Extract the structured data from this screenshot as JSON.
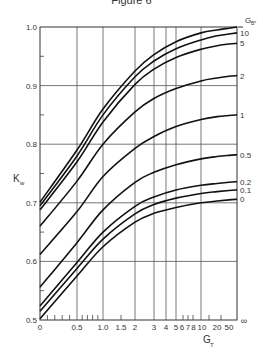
{
  "figure": {
    "title": "Figure 6"
  },
  "chart_data": {
    "type": "line",
    "title": "Figure 6",
    "xlabel": "G_T",
    "ylabel": "K_w",
    "legend_title": "G_B*",
    "x_scale": "nonlinear (compressed, G/(1+G)-like)",
    "x_tick_labels": [
      "0",
      "0.5",
      "1.0",
      "1.5",
      "2",
      "3",
      "4",
      "5",
      "6",
      "7",
      "8",
      "10",
      "20",
      "50",
      "∞"
    ],
    "y_tick_labels": [
      "0.5",
      "0.6",
      "0.7",
      "0.8",
      "0.9",
      "1.0"
    ],
    "ylim": [
      0.5,
      1.0
    ],
    "grid": true,
    "x": [
      0,
      0.5,
      1,
      2,
      3,
      5,
      10,
      20,
      50,
      "inf"
    ],
    "series": [
      {
        "name": "50",
        "values": [
          0.701,
          0.79,
          0.86,
          0.925,
          0.953,
          0.975,
          0.99,
          0.995,
          0.998,
          1.0
        ]
      },
      {
        "name": "10",
        "values": [
          0.695,
          0.78,
          0.85,
          0.915,
          0.942,
          0.963,
          0.978,
          0.985,
          0.988,
          0.99
        ]
      },
      {
        "name": "5",
        "values": [
          0.688,
          0.77,
          0.838,
          0.902,
          0.928,
          0.948,
          0.962,
          0.968,
          0.971,
          0.972
        ]
      },
      {
        "name": "2",
        "values": [
          0.66,
          0.737,
          0.8,
          0.855,
          0.878,
          0.895,
          0.908,
          0.913,
          0.916,
          0.917
        ]
      },
      {
        "name": "1",
        "values": [
          0.612,
          0.685,
          0.745,
          0.793,
          0.813,
          0.83,
          0.842,
          0.847,
          0.849,
          0.85
        ]
      },
      {
        "name": "0.5",
        "values": [
          0.556,
          0.632,
          0.688,
          0.735,
          0.752,
          0.765,
          0.775,
          0.779,
          0.781,
          0.782
        ]
      },
      {
        "name": "0.2",
        "values": [
          0.524,
          0.598,
          0.65,
          0.694,
          0.71,
          0.722,
          0.73,
          0.733,
          0.735,
          0.736
        ]
      },
      {
        "name": "0.1",
        "values": [
          0.515,
          0.588,
          0.638,
          0.681,
          0.697,
          0.708,
          0.716,
          0.719,
          0.721,
          0.722
        ]
      },
      {
        "name": "0",
        "values": [
          0.502,
          0.575,
          0.625,
          0.667,
          0.682,
          0.692,
          0.7,
          0.703,
          0.705,
          0.706
        ]
      }
    ],
    "series_labels": [
      "G_B* (top)",
      "10",
      "5",
      "2",
      "1",
      "0.5",
      "0.2",
      "0.1",
      "0"
    ],
    "legend_position": "right edge, labels at curve ends"
  },
  "axes": {
    "ylabel": "K",
    "ylabel_sub": "w",
    "xlabel": "G",
    "xlabel_sub": "T",
    "legend_title": "G",
    "legend_title_sub": "B*"
  }
}
